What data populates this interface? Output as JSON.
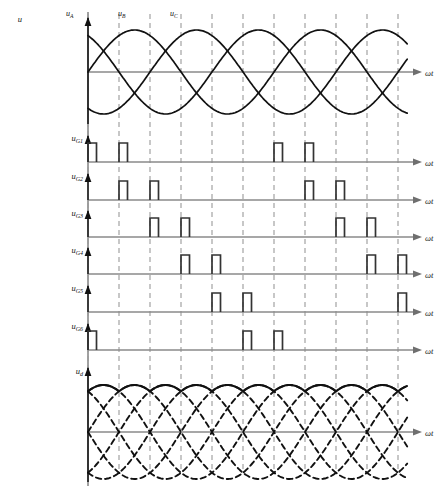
{
  "figure": {
    "caption": "",
    "axis_time_label": "ωt",
    "geometry": {
      "axis_x": 88,
      "grid_step": 31.0,
      "grid_count": 12,
      "plot_right": 408,
      "arrow_end": 422
    }
  },
  "plots": [
    {
      "id": "phase-voltages",
      "y_label": "u",
      "label_x": 14,
      "baseline": 72,
      "amplitude": 42,
      "top": 20,
      "bottom": 124,
      "time_label": "ωt",
      "curve_labels": [
        {
          "text": "u",
          "sub": "A",
          "x": 66,
          "y": 16
        },
        {
          "text": "u",
          "sub": "B",
          "x": 118,
          "y": 16
        },
        {
          "text": "u",
          "sub": "C",
          "x": 170,
          "y": 16
        }
      ]
    },
    {
      "id": "gate-1",
      "y_label": "u",
      "y_sub": "G1",
      "baseline": 162,
      "pulses": [
        0,
        1,
        6,
        7
      ]
    },
    {
      "id": "gate-2",
      "y_label": "u",
      "y_sub": "G2",
      "baseline": 200,
      "pulses": [
        1,
        2,
        7,
        8
      ]
    },
    {
      "id": "gate-3",
      "y_label": "u",
      "y_sub": "G3",
      "baseline": 237,
      "pulses": [
        2,
        3,
        8,
        9
      ]
    },
    {
      "id": "gate-4",
      "y_label": "u",
      "y_sub": "G4",
      "baseline": 274,
      "pulses": [
        3,
        4,
        9,
        10
      ]
    },
    {
      "id": "gate-5",
      "y_label": "u",
      "y_sub": "G5",
      "baseline": 312,
      "pulses": [
        4,
        5,
        10,
        11
      ]
    },
    {
      "id": "gate-6",
      "y_label": "u",
      "y_sub": "G6",
      "baseline": 350,
      "pulses": [
        0,
        5,
        6,
        11
      ]
    },
    {
      "id": "rectified-output",
      "y_label": "u",
      "y_sub": "d",
      "baseline": 432,
      "amplitude": 47,
      "top": 372,
      "bottom": 482,
      "time_label": "ωt"
    }
  ],
  "chart_data": {
    "type": "line",
    "title": "",
    "xlabel": "ωt",
    "ylabel": "u",
    "grid": true,
    "legend": "inline-curve-labels",
    "x_range_deg": [
      0,
      720
    ],
    "series": [
      {
        "name": "u_A",
        "type": "sine",
        "phase_deg": 0,
        "amplitude": 1,
        "style": "solid"
      },
      {
        "name": "u_B",
        "type": "sine",
        "phase_deg": -120,
        "amplitude": 1,
        "style": "solid"
      },
      {
        "name": "u_C",
        "type": "sine",
        "phase_deg": -240,
        "amplitude": 1,
        "style": "solid"
      }
    ],
    "gate_pulses": {
      "description": "Six-pulse thyristor bridge gate signals, double-pulse firing, 60° apart",
      "division_deg": 60,
      "pulse_width_deg": 15,
      "rows": [
        {
          "name": "u_G1",
          "pulse_divisions": [
            0,
            1,
            6,
            7
          ]
        },
        {
          "name": "u_G2",
          "pulse_divisions": [
            1,
            2,
            7,
            8
          ]
        },
        {
          "name": "u_G3",
          "pulse_divisions": [
            2,
            3,
            8,
            9
          ]
        },
        {
          "name": "u_G4",
          "pulse_divisions": [
            3,
            4,
            9,
            10
          ]
        },
        {
          "name": "u_G5",
          "pulse_divisions": [
            4,
            5,
            10,
            11
          ]
        },
        {
          "name": "u_G6",
          "pulse_divisions": [
            0,
            5,
            6,
            11
          ]
        }
      ]
    },
    "output": {
      "name": "u_d",
      "description": "Six-pulse rectified DC output: solid scalloped envelope formed by the upper segments of six dashed phase sinusoids",
      "ripple_per_cycle": 6,
      "envelope_style": "solid",
      "phase_curve_style": "dashed"
    }
  }
}
